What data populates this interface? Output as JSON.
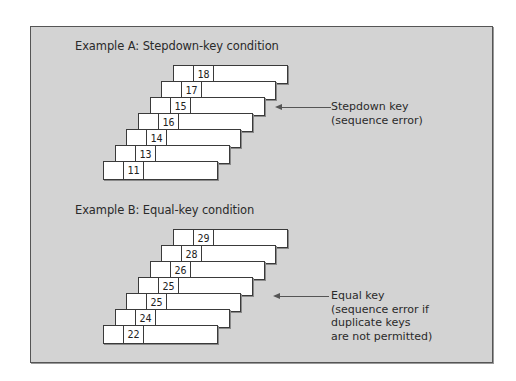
{
  "example_a": {
    "title": "Example A: Stepdown-key condition",
    "keys": [
      "18",
      "17",
      "15",
      "16",
      "14",
      "13",
      "11"
    ],
    "annotation": {
      "line1": "Stepdown key",
      "line2": "(sequence error)"
    }
  },
  "example_b": {
    "title": "Example B: Equal-key condition",
    "keys": [
      "29",
      "28",
      "26",
      "25",
      "25",
      "24",
      "22"
    ],
    "annotation": {
      "line1": "Equal key",
      "line2": "(sequence error if",
      "line3": "duplicate keys",
      "line4": "are not permitted)"
    }
  }
}
